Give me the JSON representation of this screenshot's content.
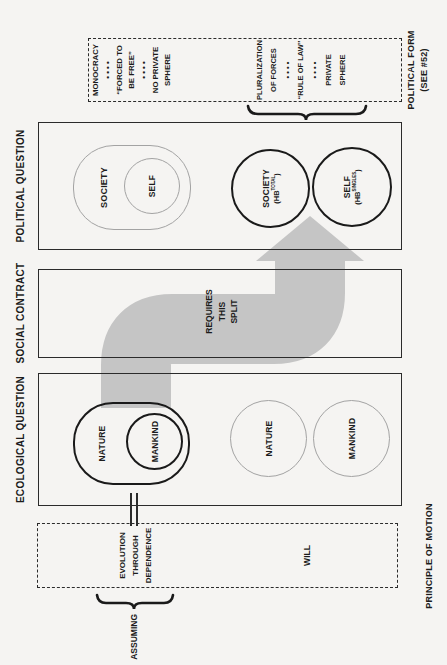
{
  "colors": {
    "paper": "#f5f4f2",
    "ink": "#1c1c1c",
    "box_line": "#2b2b2b",
    "thin_shape": "#a3a3a3",
    "arrow_gray": "#c5c5c5"
  },
  "principle": {
    "label": "PRINCIPLE OF MOTION",
    "assuming": "ASSUMING",
    "evolution": [
      "EVOLUTION",
      "THROUGH",
      "DEPENDENCE"
    ],
    "will": "WILL"
  },
  "ecological": {
    "label": "ECOLOGICAL QUESTION",
    "merged": {
      "outer": "NATURE",
      "inner": "MANKIND"
    },
    "split": {
      "first": "NATURE",
      "second": "MANKIND"
    }
  },
  "social": {
    "label": "SOCIAL CONTRACT",
    "arrow_lines": [
      "REQUIRES",
      "THIS",
      "SPLIT"
    ]
  },
  "political": {
    "label": "POLITICAL QUESTION",
    "merged": {
      "outer": "SOCIETY",
      "inner": "SELF"
    },
    "split": {
      "first": {
        "name": "SOCIETY",
        "hb_prefix": "(HB",
        "hb_sup": "TOTAL",
        "hb_suffix": ")"
      },
      "second": {
        "name": "SELF",
        "hb_prefix": "(HB",
        "hb_sup": "SINGLES",
        "hb_suffix": ")"
      }
    }
  },
  "form": {
    "label": "POLITICAL FORM",
    "see": "(SEE #52)",
    "monocracy": [
      "MONOCRACY",
      "• • • •",
      "“FORCED TO",
      "BE FREE”",
      "• • • •",
      "NO PRIVATE",
      "SPHERE"
    ],
    "pluralization": [
      "PLURALIZATION",
      "OF FORCES",
      "• • • •",
      "“RULE OF LAW”",
      "• • • •",
      "PRIVATE",
      "SPHERE"
    ]
  }
}
